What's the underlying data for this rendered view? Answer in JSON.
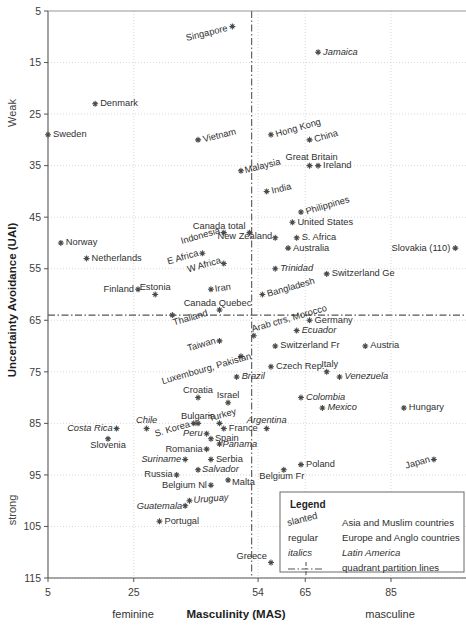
{
  "chart_data": {
    "type": "scatter",
    "title": "",
    "xlabel": "Masculinity (MAS)",
    "ylabel": "Uncertainty Avoidance (UAI)",
    "xlim": [
      5,
      95
    ],
    "ylim": [
      5,
      115
    ],
    "y_inverted": true,
    "xticks": [
      5,
      25,
      54,
      65,
      85
    ],
    "yticks": [
      5,
      15,
      25,
      35,
      45,
      55,
      65,
      75,
      85,
      95,
      105,
      115
    ],
    "x_axis_left_label": "feminine",
    "x_axis_right_label": "masculine",
    "y_axis_top_label": "Weak",
    "y_axis_bottom_label": "strong",
    "grid": true,
    "quadrant_lines": {
      "x": 52.5,
      "y": 64.0,
      "style": "dash-dot"
    },
    "legend": {
      "position": "bottom-right",
      "title": "Legend",
      "rows": [
        {
          "key": "slanted",
          "style": "slanted",
          "desc": "Asia and Muslim countries"
        },
        {
          "key": "regular",
          "style": "regular",
          "desc": "Europe and Anglo countries"
        },
        {
          "key": "italics",
          "style": "italics",
          "desc": "Latin America"
        },
        {
          "key": "line",
          "style": "line",
          "desc": "quadrant partition lines"
        }
      ]
    },
    "points": [
      {
        "label": "Singapore",
        "x": 48,
        "y": 8,
        "style": "slanted",
        "anchor": "end",
        "dx": -5,
        "dy": 2,
        "rot": -14
      },
      {
        "label": "Jamaica",
        "x": 68,
        "y": 13,
        "style": "italics",
        "anchor": "start",
        "dx": 5,
        "dy": 0,
        "rot": 0
      },
      {
        "label": "Denmark",
        "x": 16,
        "y": 23,
        "style": "regular",
        "anchor": "start",
        "dx": 5,
        "dy": 0,
        "rot": 0
      },
      {
        "label": "Sweden",
        "x": 5,
        "y": 29,
        "style": "regular",
        "anchor": "start",
        "dx": 5,
        "dy": 0,
        "rot": 0
      },
      {
        "label": "Vietnam",
        "x": 40,
        "y": 30,
        "style": "slanted",
        "anchor": "start",
        "dx": 5,
        "dy": 0,
        "rot": -14
      },
      {
        "label": "Hong Kong",
        "x": 57,
        "y": 29,
        "style": "slanted",
        "anchor": "start",
        "dx": 5,
        "dy": 0,
        "rot": -16
      },
      {
        "label": "China",
        "x": 66,
        "y": 30,
        "style": "slanted",
        "anchor": "start",
        "dx": 5,
        "dy": 0,
        "rot": -16
      },
      {
        "label": "Great Britain",
        "x": 66,
        "y": 35,
        "style": "regular",
        "anchor": "middle",
        "dx": 2,
        "dy": -8,
        "rot": 0
      },
      {
        "label": "Ireland",
        "x": 68,
        "y": 35,
        "style": "regular",
        "anchor": "start",
        "dx": 5,
        "dy": 0,
        "rot": 0
      },
      {
        "label": "Malaysia",
        "x": 50,
        "y": 36,
        "style": "slanted",
        "anchor": "start",
        "dx": 4,
        "dy": 0,
        "rot": -14
      },
      {
        "label": "India",
        "x": 56,
        "y": 40,
        "style": "slanted",
        "anchor": "start",
        "dx": 5,
        "dy": 0,
        "rot": -14
      },
      {
        "label": "Philippines",
        "x": 64,
        "y": 44,
        "style": "slanted",
        "anchor": "start",
        "dx": 5,
        "dy": 0,
        "rot": -16
      },
      {
        "label": "Canada total",
        "x": 52,
        "y": 48,
        "style": "regular",
        "anchor": "end",
        "dx": -4,
        "dy": -6,
        "rot": 0
      },
      {
        "label": "United States",
        "x": 62,
        "y": 46,
        "style": "regular",
        "anchor": "start",
        "dx": 5,
        "dy": 0,
        "rot": 0
      },
      {
        "label": "Indonesia",
        "x": 46,
        "y": 48,
        "style": "slanted",
        "anchor": "end",
        "dx": -4,
        "dy": -2,
        "rot": -16
      },
      {
        "label": "S. Africa",
        "x": 63,
        "y": 49,
        "style": "regular",
        "anchor": "start",
        "dx": 5,
        "dy": 0,
        "rot": 0
      },
      {
        "label": "New Zealand",
        "x": 58,
        "y": 49,
        "style": "regular",
        "anchor": "end",
        "dx": -3,
        "dy": -1,
        "rot": 0
      },
      {
        "label": "Australia",
        "x": 61,
        "y": 51,
        "style": "regular",
        "anchor": "start",
        "dx": 5,
        "dy": 0,
        "rot": 0
      },
      {
        "label": "Norway",
        "x": 8,
        "y": 50,
        "style": "regular",
        "anchor": "start",
        "dx": 5,
        "dy": 0,
        "rot": 0
      },
      {
        "label": "Netherlands",
        "x": 14,
        "y": 53,
        "style": "regular",
        "anchor": "start",
        "dx": 5,
        "dy": 0,
        "rot": 0
      },
      {
        "label": "Slovakia (110)",
        "x": 100,
        "y": 51,
        "style": "regular",
        "anchor": "end",
        "dx": -5,
        "dy": 0,
        "rot": 0
      },
      {
        "label": "E Africa",
        "x": 41,
        "y": 52,
        "style": "slanted",
        "anchor": "end",
        "dx": -4,
        "dy": 0,
        "rot": -16
      },
      {
        "label": "W Africa",
        "x": 46,
        "y": 54,
        "style": "slanted",
        "anchor": "end",
        "dx": -3,
        "dy": -3,
        "rot": -16
      },
      {
        "label": "Trinidad",
        "x": 58,
        "y": 55,
        "style": "italics",
        "anchor": "start",
        "dx": 5,
        "dy": 0,
        "rot": 0
      },
      {
        "label": "Switzerland Ge",
        "x": 70,
        "y": 56,
        "style": "regular",
        "anchor": "start",
        "dx": 5,
        "dy": 0,
        "rot": 0
      },
      {
        "label": "Iran",
        "x": 43,
        "y": 59,
        "style": "slanted",
        "anchor": "start",
        "dx": 4,
        "dy": 0,
        "rot": -8
      },
      {
        "label": "Finland",
        "x": 26,
        "y": 59,
        "style": "regular",
        "anchor": "end",
        "dx": -4,
        "dy": 0,
        "rot": 0
      },
      {
        "label": "Estonia",
        "x": 30,
        "y": 60,
        "style": "regular",
        "anchor": "middle",
        "dx": 0,
        "dy": -7,
        "rot": 0
      },
      {
        "label": "Bangladesh",
        "x": 55,
        "y": 60,
        "style": "slanted",
        "anchor": "start",
        "dx": 5,
        "dy": 0,
        "rot": -16
      },
      {
        "label": "Canada Quebec",
        "x": 45,
        "y": 63,
        "style": "regular",
        "anchor": "middle",
        "dx": -2,
        "dy": -6,
        "rot": 0
      },
      {
        "label": "Thailand",
        "x": 34,
        "y": 64,
        "style": "slanted",
        "anchor": "start",
        "dx": 1,
        "dy": 8,
        "rot": -16
      },
      {
        "label": "Arab ctrs, Morocco",
        "x": 53,
        "y": 68,
        "style": "slanted",
        "anchor": "start",
        "dx": -2,
        "dy": -6,
        "rot": -16
      },
      {
        "label": "Germany",
        "x": 66,
        "y": 65,
        "style": "regular",
        "anchor": "start",
        "dx": 5,
        "dy": 0,
        "rot": 0
      },
      {
        "label": "Ecuador",
        "x": 63,
        "y": 67,
        "style": "italics",
        "anchor": "start",
        "dx": 5,
        "dy": 0,
        "rot": 0
      },
      {
        "label": "Taiwan",
        "x": 45,
        "y": 69,
        "style": "slanted",
        "anchor": "end",
        "dx": -4,
        "dy": 0,
        "rot": -16
      },
      {
        "label": "Switzerland Fr",
        "x": 58,
        "y": 70,
        "style": "regular",
        "anchor": "start",
        "dx": 5,
        "dy": 0,
        "rot": 0
      },
      {
        "label": "Austria",
        "x": 79,
        "y": 70,
        "style": "regular",
        "anchor": "start",
        "dx": 5,
        "dy": 0,
        "rot": 0
      },
      {
        "label": "Luxembourg, Pakistan",
        "x": 50,
        "y": 72,
        "style": "slanted",
        "anchor": "end",
        "dx": 10,
        "dy": 0,
        "rot": -16
      },
      {
        "label": "Czech Rep.",
        "x": 57,
        "y": 74,
        "style": "regular",
        "anchor": "start",
        "dx": 5,
        "dy": 0,
        "rot": 0
      },
      {
        "label": "Italy",
        "x": 70,
        "y": 75,
        "style": "regular",
        "anchor": "middle",
        "dx": 3,
        "dy": -7,
        "rot": 0
      },
      {
        "label": "Brazil",
        "x": 49,
        "y": 76,
        "style": "italics",
        "anchor": "start",
        "dx": 5,
        "dy": 0,
        "rot": 0
      },
      {
        "label": "Venezuela",
        "x": 73,
        "y": 76,
        "style": "italics",
        "anchor": "start",
        "dx": 5,
        "dy": 0,
        "rot": 0
      },
      {
        "label": "Croatia",
        "x": 40,
        "y": 80,
        "style": "regular",
        "anchor": "middle",
        "dx": 0,
        "dy": -7,
        "rot": 0
      },
      {
        "label": "Israel",
        "x": 47,
        "y": 81,
        "style": "regular",
        "anchor": "middle",
        "dx": 0,
        "dy": -7,
        "rot": 0
      },
      {
        "label": "Colombia",
        "x": 64,
        "y": 80,
        "style": "italics",
        "anchor": "start",
        "dx": 5,
        "dy": 0,
        "rot": 0
      },
      {
        "label": "Mexico",
        "x": 69,
        "y": 82,
        "style": "italics",
        "anchor": "start",
        "dx": 5,
        "dy": 0,
        "rot": 0
      },
      {
        "label": "Hungary",
        "x": 88,
        "y": 82,
        "style": "regular",
        "anchor": "start",
        "dx": 5,
        "dy": 0,
        "rot": 0
      },
      {
        "label": "Bulgaria",
        "x": 40,
        "y": 85,
        "style": "regular",
        "anchor": "middle",
        "dx": 0,
        "dy": -7,
        "rot": 0
      },
      {
        "label": "Turkey",
        "x": 45,
        "y": 85,
        "style": "slanted",
        "anchor": "middle",
        "dx": 3,
        "dy": -8,
        "rot": -16
      },
      {
        "label": "Argentina",
        "x": 56,
        "y": 86,
        "style": "italics",
        "anchor": "middle",
        "dx": 0,
        "dy": -8,
        "rot": 0
      },
      {
        "label": "Chile",
        "x": 28,
        "y": 86,
        "style": "italics",
        "anchor": "middle",
        "dx": 0,
        "dy": -8,
        "rot": 0
      },
      {
        "label": "Costa Rica",
        "x": 21,
        "y": 86,
        "style": "italics",
        "anchor": "end",
        "dx": -4,
        "dy": 0,
        "rot": 0
      },
      {
        "label": "S. Korea",
        "x": 39,
        "y": 85,
        "style": "slanted",
        "anchor": "end",
        "dx": -4,
        "dy": 1,
        "rot": -16
      },
      {
        "label": "France",
        "x": 46,
        "y": 86,
        "style": "regular",
        "anchor": "start",
        "dx": 5,
        "dy": 0,
        "rot": 0
      },
      {
        "label": "Slovenia",
        "x": 19,
        "y": 88,
        "style": "regular",
        "anchor": "middle",
        "dx": 0,
        "dy": 7,
        "rot": 0
      },
      {
        "label": "Peru",
        "x": 42,
        "y": 87,
        "style": "italics",
        "anchor": "end",
        "dx": -4,
        "dy": 0,
        "rot": 0
      },
      {
        "label": "Spain",
        "x": 43,
        "y": 88,
        "style": "regular",
        "anchor": "start",
        "dx": 4,
        "dy": 0,
        "rot": 0
      },
      {
        "label": "Panama",
        "x": 45,
        "y": 89,
        "style": "italics",
        "anchor": "start",
        "dx": 3,
        "dy": 1,
        "rot": 0
      },
      {
        "label": "Romania",
        "x": 42,
        "y": 90,
        "style": "regular",
        "anchor": "end",
        "dx": -4,
        "dy": 0,
        "rot": 0
      },
      {
        "label": "Suriname",
        "x": 37,
        "y": 92,
        "style": "italics",
        "anchor": "end",
        "dx": -4,
        "dy": 0,
        "rot": 0
      },
      {
        "label": "Serbia",
        "x": 43,
        "y": 92,
        "style": "regular",
        "anchor": "start",
        "dx": 5,
        "dy": 0,
        "rot": 0
      },
      {
        "label": "Russia",
        "x": 35,
        "y": 95,
        "style": "regular",
        "anchor": "end",
        "dx": -4,
        "dy": 0,
        "rot": 0
      },
      {
        "label": "Salvador",
        "x": 40,
        "y": 94,
        "style": "italics",
        "anchor": "start",
        "dx": 4,
        "dy": 0,
        "rot": 0
      },
      {
        "label": "Poland",
        "x": 64,
        "y": 93,
        "style": "regular",
        "anchor": "start",
        "dx": 5,
        "dy": 0,
        "rot": 0
      },
      {
        "label": "Japan",
        "x": 95,
        "y": 92,
        "style": "slanted",
        "anchor": "end",
        "dx": -4,
        "dy": 0,
        "rot": -16
      },
      {
        "label": "Belgium Fr",
        "x": 60,
        "y": 94,
        "style": "regular",
        "anchor": "middle",
        "dx": -2,
        "dy": 7,
        "rot": 0
      },
      {
        "label": "Malta",
        "x": 47,
        "y": 96,
        "style": "regular",
        "anchor": "start",
        "dx": 4,
        "dy": 2,
        "rot": 0
      },
      {
        "label": "Belgium Nl",
        "x": 43,
        "y": 97,
        "style": "regular",
        "anchor": "end",
        "dx": -4,
        "dy": 0,
        "rot": 0
      },
      {
        "label": "Uruguay",
        "x": 38,
        "y": 100,
        "style": "italics",
        "anchor": "start",
        "dx": 4,
        "dy": 0,
        "rot": -5
      },
      {
        "label": "Guatemala",
        "x": 37,
        "y": 101,
        "style": "italics",
        "anchor": "end",
        "dx": -3,
        "dy": 1,
        "rot": 0
      },
      {
        "label": "Portugal",
        "x": 31,
        "y": 104,
        "style": "regular",
        "anchor": "start",
        "dx": 5,
        "dy": 0,
        "rot": 0
      },
      {
        "label": "Greece",
        "x": 57,
        "y": 112,
        "style": "regular",
        "anchor": "end",
        "dx": -4,
        "dy": -6,
        "rot": 0
      }
    ]
  }
}
